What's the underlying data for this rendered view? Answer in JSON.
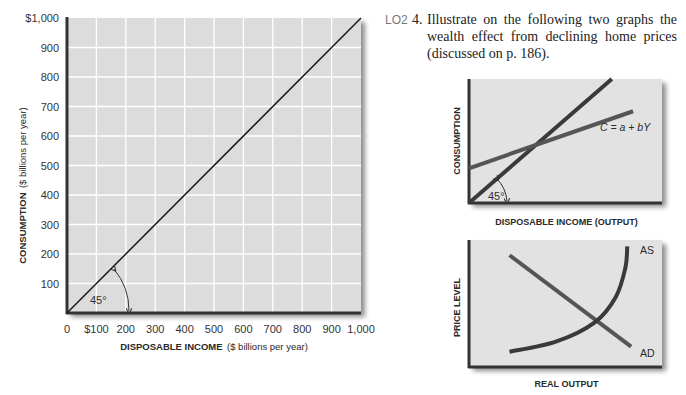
{
  "question": {
    "lo_tag": "LO2",
    "number": "4.",
    "text": "Illustrate on the following two graphs the wealth effect from declining home prices (discussed on p. 186)."
  },
  "chart_data": [
    {
      "type": "line",
      "id": "main-45-degree-line",
      "title": "",
      "xlabel_bold": "DISPOSABLE INCOME",
      "xlabel_rest": "($ billions per year)",
      "ylabel_bold": "CONSUMPTION",
      "ylabel_rest": "($ billions per year)",
      "xlim": [
        0,
        1000
      ],
      "ylim": [
        0,
        1000
      ],
      "grid": true,
      "x_ticks": [
        {
          "value": 0,
          "label": "0"
        },
        {
          "value": 100,
          "label": "$100"
        },
        {
          "value": 200,
          "label": "200"
        },
        {
          "value": 300,
          "label": "300"
        },
        {
          "value": 400,
          "label": "400"
        },
        {
          "value": 500,
          "label": "500"
        },
        {
          "value": 600,
          "label": "600"
        },
        {
          "value": 700,
          "label": "700"
        },
        {
          "value": 800,
          "label": "800"
        },
        {
          "value": 900,
          "label": "900"
        },
        {
          "value": 1000,
          "label": "1,000"
        }
      ],
      "y_ticks": [
        {
          "value": 100,
          "label": "100"
        },
        {
          "value": 200,
          "label": "200"
        },
        {
          "value": 300,
          "label": "300"
        },
        {
          "value": 400,
          "label": "400"
        },
        {
          "value": 500,
          "label": "500"
        },
        {
          "value": 600,
          "label": "600"
        },
        {
          "value": 700,
          "label": "700"
        },
        {
          "value": 800,
          "label": "800"
        },
        {
          "value": 900,
          "label": "900"
        },
        {
          "value": 1000,
          "label": "$1,000"
        }
      ],
      "series": [
        {
          "name": "45-degree line",
          "x": [
            0,
            1000
          ],
          "y": [
            0,
            1000
          ],
          "color": "#1a1a1a"
        }
      ],
      "annotations": [
        {
          "text": "45°",
          "type": "angle-marker"
        }
      ],
      "colors": {
        "plot_bg": "#dcdcdc",
        "grid": "#ffffff",
        "axis": "#333333"
      }
    },
    {
      "type": "line",
      "id": "consumption-function-sketch",
      "xlabel": "DISPOSABLE INCOME (OUTPUT)",
      "ylabel": "CONSUMPTION",
      "xlim": [
        0,
        1
      ],
      "ylim": [
        0,
        1
      ],
      "grid": false,
      "series": [
        {
          "name": "45-degree line",
          "x": [
            0,
            0.74
          ],
          "y": [
            0,
            1.0
          ],
          "color": "#3a3a3a"
        },
        {
          "name": "C = a + bY",
          "x": [
            0,
            0.85
          ],
          "y": [
            0.28,
            0.74
          ],
          "color": "#555555",
          "label": "C = a + bY"
        }
      ],
      "annotations": [
        {
          "text": "45°",
          "type": "angle-marker"
        }
      ],
      "colors": {
        "plot_bg": "#e2e2e2",
        "axis": "#333333"
      }
    },
    {
      "type": "line",
      "id": "as-ad-sketch",
      "xlabel": "REAL OUTPUT",
      "ylabel": "PRICE LEVEL",
      "xlim": [
        0,
        1
      ],
      "ylim": [
        0,
        1
      ],
      "grid": false,
      "series": [
        {
          "name": "AD",
          "x": [
            0.21,
            0.84
          ],
          "y": [
            0.88,
            0.16
          ],
          "color": "#555555",
          "label": "AD"
        },
        {
          "name": "AS",
          "x": [
            0.21,
            0.45,
            0.65,
            0.76,
            0.81,
            0.82
          ],
          "y": [
            0.12,
            0.2,
            0.35,
            0.55,
            0.78,
            0.95
          ],
          "color": "#3a3a3a",
          "label": "AS"
        }
      ],
      "colors": {
        "plot_bg": "#e2e2e2",
        "axis": "#333333"
      }
    }
  ]
}
